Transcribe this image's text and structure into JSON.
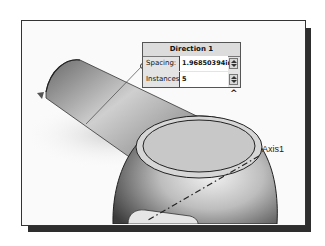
{
  "dialog": {
    "title": "Direction 1",
    "spacing_label": "Spacing:",
    "spacing_value": "1.96850394in",
    "instances_label": "Instances:",
    "instances_value": "5",
    "collapse_icon": "^"
  },
  "viewport": {
    "axis_label": "Axis1"
  },
  "colors": {
    "frame_border": "#333333",
    "shadow": "#2e2e2e",
    "dialog_bg": "#e4e4e4",
    "face_fill": "#c8c8c8"
  }
}
